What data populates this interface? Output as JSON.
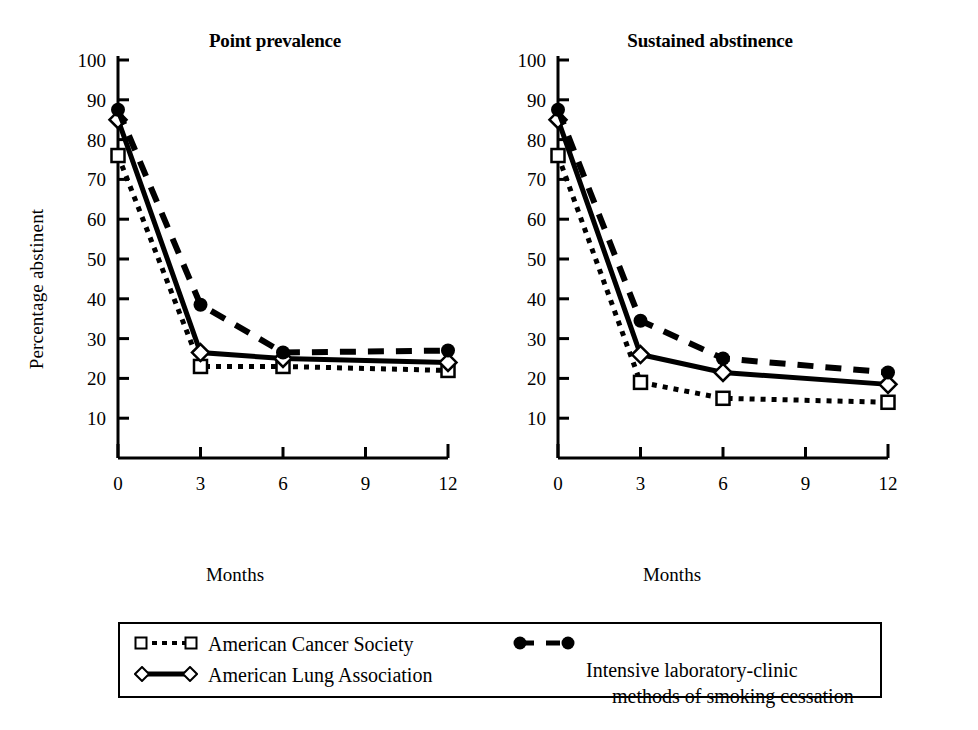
{
  "figure": {
    "y_axis_title": "Percentage abstinent",
    "x_axis_title_left": "Months",
    "x_axis_title_right": "Months"
  },
  "legend": {
    "entries": [
      {
        "marker": "open-square",
        "line": "dotted",
        "label": "American Cancer Society"
      },
      {
        "marker": "open-diamond",
        "line": "solid",
        "label": "American Lung Association"
      },
      {
        "marker": "filled-circle",
        "line": "dashed",
        "label_line1": "Intensive laboratory-clinic",
        "label_line2": "methods of smoking cessation"
      }
    ]
  },
  "chart_data": [
    {
      "type": "line",
      "title": "Point prevalence",
      "xlabel": "Months",
      "ylabel": "Percentage abstinent",
      "x": [
        0,
        3,
        6,
        12
      ],
      "xlim": [
        0,
        12
      ],
      "xticks": [
        0,
        3,
        6,
        9,
        12
      ],
      "xticklabels": [
        "0",
        "3",
        "6",
        "9",
        "12"
      ],
      "ylim": [
        0,
        100
      ],
      "yticks": [
        10,
        20,
        30,
        40,
        50,
        60,
        70,
        80,
        90,
        100
      ],
      "yticklabels": [
        "10",
        "20",
        "30",
        "40",
        "50",
        "60",
        "70",
        "80",
        "90",
        "100"
      ],
      "grid": false,
      "legend_position": "below-figure",
      "series": [
        {
          "name": "American Cancer Society",
          "marker": "open-square",
          "line": "dotted",
          "values": [
            76,
            23,
            23,
            22
          ]
        },
        {
          "name": "American Lung Association",
          "marker": "open-diamond",
          "line": "solid",
          "values": [
            85,
            26.5,
            25,
            24
          ]
        },
        {
          "name": "Intensive laboratory-clinic methods of smoking cessation",
          "marker": "filled-circle",
          "line": "dashed",
          "values": [
            87.5,
            38.5,
            26.5,
            27
          ]
        }
      ]
    },
    {
      "type": "line",
      "title": "Sustained abstinence",
      "xlabel": "Months",
      "ylabel": "Percentage abstinent",
      "x": [
        0,
        3,
        6,
        12
      ],
      "xlim": [
        0,
        12
      ],
      "xticks": [
        0,
        3,
        6,
        9,
        12
      ],
      "xticklabels": [
        "0",
        "3",
        "6",
        "9",
        "12"
      ],
      "ylim": [
        0,
        100
      ],
      "yticks": [
        10,
        20,
        30,
        40,
        50,
        60,
        70,
        80,
        90,
        100
      ],
      "yticklabels": [
        "10",
        "20",
        "30",
        "40",
        "50",
        "60",
        "70",
        "80",
        "90",
        "100"
      ],
      "grid": false,
      "legend_position": "below-figure",
      "series": [
        {
          "name": "American Cancer Society",
          "marker": "open-square",
          "line": "dotted",
          "values": [
            76,
            19,
            15,
            14
          ]
        },
        {
          "name": "American Lung Association",
          "marker": "open-diamond",
          "line": "solid",
          "values": [
            85,
            26,
            21.5,
            18.5
          ]
        },
        {
          "name": "Intensive laboratory-clinic methods of smoking cessation",
          "marker": "filled-circle",
          "line": "dashed",
          "values": [
            87.5,
            34.5,
            25,
            21.5
          ]
        }
      ]
    }
  ],
  "style": {
    "ink": "#000000",
    "background": "#ffffff"
  }
}
